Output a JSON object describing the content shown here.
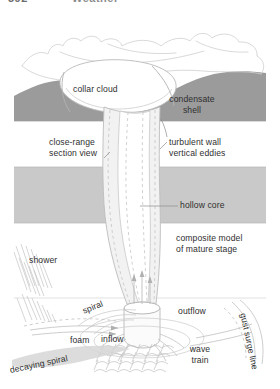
{
  "page_header": {
    "folio": "592",
    "section": "Weather"
  },
  "figure": {
    "name": "tornado-waterspout-composite-model",
    "palette": {
      "band_dark": "#9b9b9b",
      "band_light": "#c9c9c9",
      "outline": "#8e8e8e",
      "faint_outline": "#cfcfcf",
      "funnel_fill": "#efefef",
      "funnel_edge": "#b4b4b4",
      "text": "#2f2f2f",
      "background": "#ffffff"
    },
    "labels": {
      "collar_cloud": "collar cloud",
      "condensate_shell": "condensate\nshell",
      "close_range_section_view": "close-range\nsection view",
      "turbulent_wall_vertical_eddies": "turbulent wall\nvertical eddies",
      "hollow_core": "hollow core",
      "composite_model_of_mature_stage": "composite model\nof mature stage",
      "shower": "shower",
      "spiral": "spiral",
      "outflow": "outflow",
      "gust_surge_line": "gust surge line",
      "foam": "foam",
      "inflow": "inflow",
      "wave_train": "wave\ntrain",
      "decaying_spiral": "decaying spiral"
    }
  }
}
